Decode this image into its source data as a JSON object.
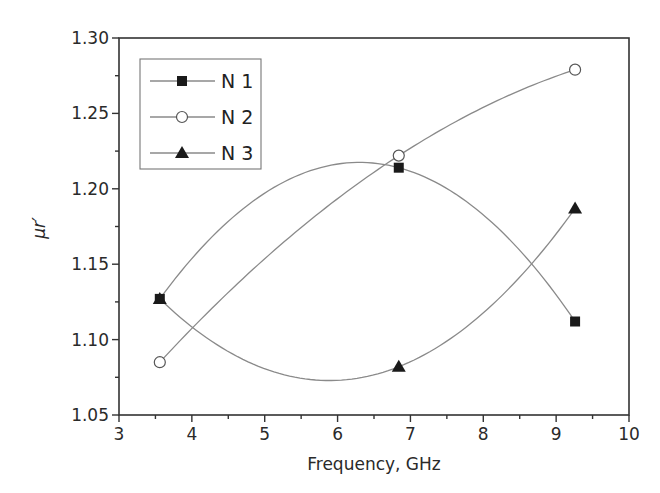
{
  "chart_data": {
    "type": "line",
    "title": "",
    "xlabel": "Frequency, GHz",
    "ylabel": "μr′",
    "xlim": [
      3,
      10
    ],
    "ylim": [
      1.05,
      1.3
    ],
    "xticks": [
      3,
      4,
      5,
      6,
      7,
      8,
      9,
      10
    ],
    "xtick_labels": [
      "3",
      "4",
      "5",
      "6",
      "7",
      "8",
      "9",
      "10"
    ],
    "yticks": [
      1.05,
      1.1,
      1.15,
      1.2,
      1.25,
      1.3
    ],
    "ytick_labels": [
      "1.05",
      "1.10",
      "1.15",
      "1.20",
      "1.25",
      "1.30"
    ],
    "grid": false,
    "legend_position": "upper left",
    "smooth_curves": true,
    "series": [
      {
        "name": "N 1",
        "marker": "filled-square",
        "x": [
          3.56,
          6.84,
          9.26
        ],
        "values": [
          1.127,
          1.214,
          1.112
        ]
      },
      {
        "name": "N 2",
        "marker": "open-circle",
        "x": [
          3.56,
          6.84,
          9.26
        ],
        "values": [
          1.085,
          1.222,
          1.279
        ]
      },
      {
        "name": "N 3",
        "marker": "filled-triangle",
        "x": [
          3.56,
          6.84,
          9.26
        ],
        "values": [
          1.127,
          1.082,
          1.187
        ]
      }
    ],
    "colors": {
      "line": "#8a8a8a",
      "marker": "#1a1a1a",
      "axis": "#333333"
    }
  }
}
